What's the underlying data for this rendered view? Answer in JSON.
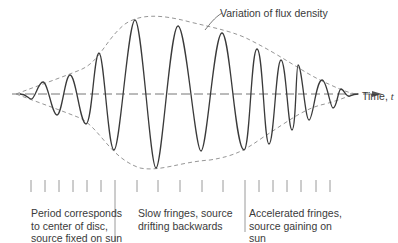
{
  "figure": {
    "type": "waveform-diagram",
    "annotation_envelope": "Variation of flux density",
    "axis_label_prefix": "Time, ",
    "axis_label_var": "t",
    "regions": [
      {
        "lines": [
          "Period corresponds",
          "to center of disc,",
          "source fixed on sun"
        ]
      },
      {
        "lines": [
          "Slow fringes, source",
          "drifting backwards"
        ]
      },
      {
        "lines": [
          "Accelerated fringes,",
          "source gaining on",
          "sun"
        ]
      }
    ],
    "tick_x": [
      31,
      45,
      59,
      73,
      87,
      101,
      115,
      137,
      158,
      180,
      202,
      223,
      245,
      259,
      273,
      287,
      301,
      316,
      330
    ],
    "divider_x": [
      115,
      245
    ],
    "colors": {
      "wave": "#3a3a3a",
      "envelope": "#8a8a8a",
      "axis": "#777777",
      "ticks": "#9a9a9a"
    }
  }
}
